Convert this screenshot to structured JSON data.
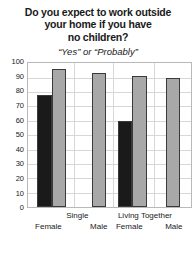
{
  "header": {
    "title_lines": [
      "Do you expect to work outside",
      "your home if you have",
      "no children?"
    ],
    "subtitle": "“Yes” or “Probably”"
  },
  "chart_data": {
    "type": "bar",
    "title": "Do you expect to work outside your home if you have no children?",
    "subtitle": "“Yes” or “Probably”",
    "xlabel": "",
    "ylabel": "",
    "ylim": [
      0,
      100
    ],
    "yticks": [
      0,
      10,
      20,
      30,
      40,
      50,
      60,
      70,
      80,
      90,
      100
    ],
    "grid": true,
    "legend": "none",
    "groups": [
      "Single",
      "Living Together"
    ],
    "categories": [
      "Female",
      "Male",
      "Female",
      "Male"
    ],
    "bars": [
      {
        "group": "Single",
        "category": "Female",
        "series": "black",
        "value": 78
      },
      {
        "group": "Single",
        "category": "Female",
        "series": "gray",
        "value": 96
      },
      {
        "group": "Single",
        "category": "Male",
        "series": "gray",
        "value": 93
      },
      {
        "group": "Living Together",
        "category": "Female",
        "series": "black",
        "value": 60
      },
      {
        "group": "Living Together",
        "category": "Female",
        "series": "gray",
        "value": 91
      },
      {
        "group": "Living Together",
        "category": "Male",
        "series": "gray",
        "value": 90
      }
    ],
    "colors": {
      "black_series": "#1a1a1a",
      "gray_series": "#a8a8a8",
      "bar_outline": "#3a3a3a",
      "gridline": "#d7d7d7",
      "plot_border": "#b9b9b9",
      "background": "#ffffff"
    }
  },
  "axis_labels": {
    "groups": [
      {
        "label": "Single",
        "center_pct": 30.5
      },
      {
        "label": "Living Together",
        "center_pct": 71.5
      }
    ],
    "categories": [
      {
        "label": "Female",
        "center_pct": 13.0
      },
      {
        "label": "Male",
        "center_pct": 43.5
      },
      {
        "label": "Female",
        "center_pct": 62.0
      },
      {
        "label": "Male",
        "center_pct": 89.0
      }
    ]
  }
}
